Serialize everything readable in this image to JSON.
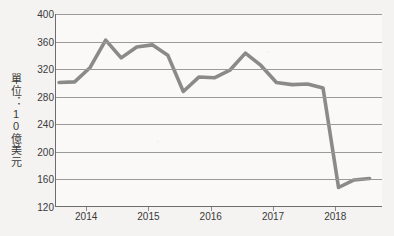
{
  "chart_data": {
    "type": "line",
    "title": "",
    "xlabel": "",
    "ylabel": "單位：10億美元",
    "ylim": [
      120,
      400
    ],
    "xlim": [
      2013.5,
      2018.75
    ],
    "grid": true,
    "legend": "none",
    "line_color": "#8a8a8a",
    "y_ticks": [
      400,
      360,
      320,
      280,
      240,
      200,
      160,
      120
    ],
    "x_ticks": [
      2014,
      2015,
      2016,
      2017,
      2018
    ],
    "x_tick_labels": [
      "2014",
      "2015",
      "2016",
      "2017",
      "2018"
    ],
    "x": [
      2013.55,
      2013.8,
      2014.05,
      2014.3,
      2014.55,
      2014.8,
      2015.05,
      2015.3,
      2015.55,
      2015.8,
      2016.05,
      2016.3,
      2016.55,
      2016.8,
      2017.05,
      2017.3,
      2017.55,
      2017.8,
      2018.05,
      2018.3,
      2018.55
    ],
    "values": [
      300,
      301,
      322,
      362,
      336,
      352,
      355,
      340,
      287,
      308,
      307,
      318,
      343,
      325,
      300,
      297,
      298,
      292,
      147,
      158,
      160
    ],
    "series": [
      {
        "name": "單位：10億美元",
        "values": [
          300,
          301,
          322,
          362,
          336,
          352,
          355,
          340,
          287,
          308,
          307,
          318,
          343,
          325,
          300,
          297,
          298,
          292,
          147,
          158,
          160
        ]
      }
    ]
  },
  "axes": {
    "y_title": "單位：10億美元",
    "y_tick_labels": [
      "400",
      "360",
      "320",
      "280",
      "240",
      "200",
      "160",
      "120"
    ],
    "x_tick_labels": [
      "2014",
      "2015",
      "2016",
      "2017",
      "2018"
    ]
  }
}
